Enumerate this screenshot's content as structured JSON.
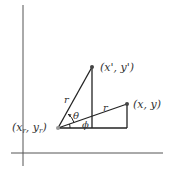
{
  "diagram": {
    "colors": {
      "line": "#222222",
      "axis": "#555555",
      "point": "#444444",
      "background": "#ffffff"
    },
    "axes": {
      "y_axis": {
        "x": 23,
        "y1": 5,
        "y2": 166
      },
      "x_axis": {
        "y": 153,
        "x1": 11,
        "x2": 163
      }
    },
    "points": {
      "pivot": {
        "label": "(x_r, y_r)",
        "display_main": "(x",
        "sub1": "r",
        "mid": ", y",
        "sub2": "r",
        "close": ")",
        "x": 58,
        "y": 128
      },
      "rotated": {
        "label": "(x', y')",
        "x": 92,
        "y": 67
      },
      "original": {
        "label": "(x, y)",
        "x": 127,
        "y": 104
      }
    },
    "labels": {
      "r_rotated": "r",
      "r_original": "r",
      "theta": "θ",
      "phi": "ϕ"
    }
  }
}
